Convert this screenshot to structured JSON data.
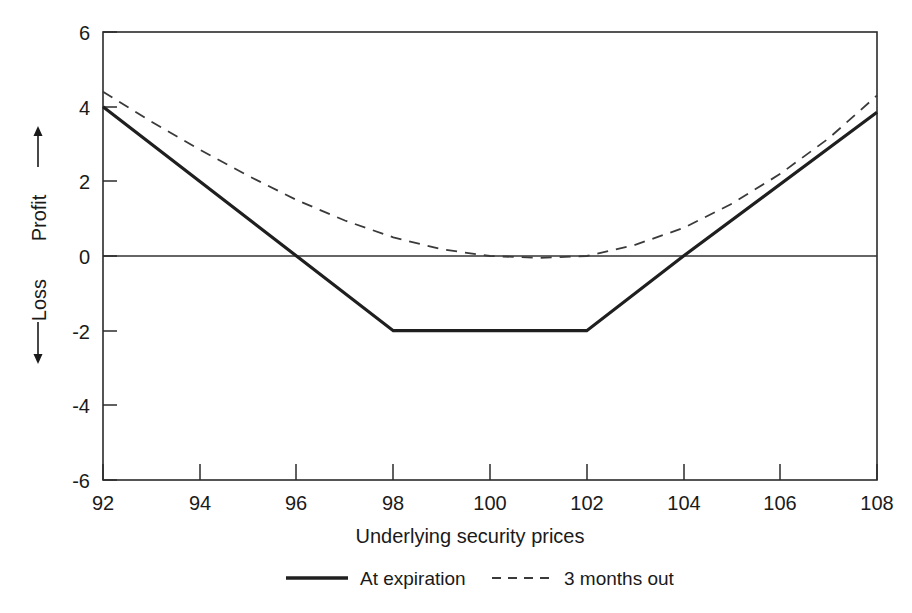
{
  "chart_data": {
    "type": "line",
    "title": "",
    "xlabel": "Underlying security prices",
    "ylabel_profit": "Profit",
    "ylabel_loss": "Loss",
    "xlim": [
      92,
      108
    ],
    "ylim": [
      -6,
      6
    ],
    "grid": false,
    "legend_position": "bottom-center",
    "xticks": [
      92,
      94,
      96,
      98,
      100,
      102,
      104,
      106,
      108
    ],
    "xtick_labels": [
      "92",
      "94",
      "96",
      "98",
      "100",
      "102",
      "104",
      "106",
      "108"
    ],
    "yticks": [
      6,
      4,
      2,
      0,
      -2,
      -4,
      -6
    ],
    "ytick_labels": [
      "6",
      "4",
      "2",
      "0",
      "-2",
      "-4",
      "-6"
    ],
    "zero_reference_line": 0,
    "series": [
      {
        "name": "At expiration",
        "style": "solid",
        "x": [
          92,
          96,
          98,
          102,
          104,
          108
        ],
        "values": [
          4.0,
          0.0,
          -2.0,
          -2.0,
          0.0,
          3.85
        ]
      },
      {
        "name": "3 months out",
        "style": "dashed",
        "x": [
          92,
          93,
          94,
          95,
          96,
          97,
          98,
          99,
          100,
          101,
          102,
          103,
          104,
          105,
          106,
          107,
          108
        ],
        "values": [
          4.4,
          3.6,
          2.85,
          2.15,
          1.5,
          0.95,
          0.5,
          0.18,
          0.0,
          -0.05,
          0.0,
          0.3,
          0.75,
          1.4,
          2.2,
          3.15,
          4.3
        ]
      }
    ]
  },
  "legend": {
    "items": [
      {
        "label": "At expiration",
        "style": "solid"
      },
      {
        "label": "3 months out",
        "style": "dashed"
      }
    ]
  },
  "axes": {
    "y_axis_caption_profit": "Profit",
    "y_axis_caption_loss": "Loss",
    "x_axis_caption": "Underlying security prices"
  },
  "colors": {
    "solid_series": "#1f1f1f",
    "dashed_series": "#3a3a3a",
    "axis": "#2b2b2b",
    "text": "#1a1a1a",
    "background": "#ffffff"
  }
}
